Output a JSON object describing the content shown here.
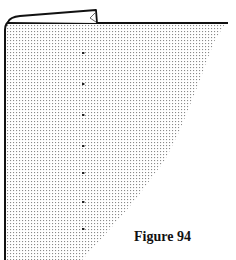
{
  "figure": {
    "caption": "Figure 94"
  },
  "colors": {
    "outline": "#111111",
    "stipple": "#8a8a8a",
    "background": "#ffffff",
    "dot": "#222222"
  },
  "marking_dots": {
    "x": 83,
    "y": [
      53,
      84,
      115,
      146,
      173,
      202,
      229
    ]
  }
}
